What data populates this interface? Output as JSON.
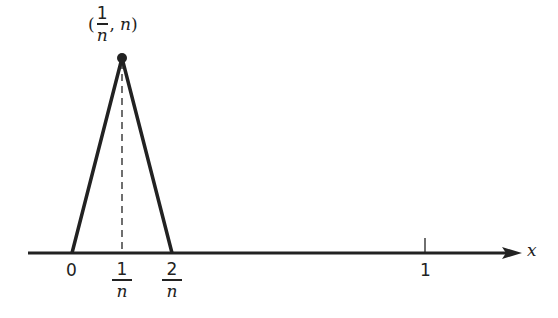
{
  "diagram": {
    "peak_label": {
      "open": "(",
      "num": "1",
      "den": "n",
      "sep": ",",
      "value": "n",
      "close": ")"
    },
    "axis_label": "x",
    "ticks": [
      {
        "label": "0"
      },
      {
        "num": "1",
        "den": "n"
      },
      {
        "num": "2",
        "den": "n"
      },
      {
        "label": "1"
      }
    ],
    "colors": {
      "line": "#222222",
      "background": "#ffffff"
    }
  }
}
